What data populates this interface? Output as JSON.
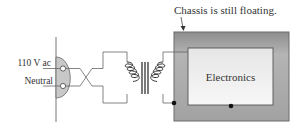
{
  "diagram": {
    "title_note": "Chassis is still floating.",
    "outlet": {
      "hot_label": "110 V ac",
      "neutral_label": "Neutral"
    },
    "transformer": {
      "type": "isolation-transformer",
      "primary": "primary-coil",
      "secondary": "secondary-coil"
    },
    "chassis": {
      "label": "Chassis is still floating.",
      "inner_label": "Electronics"
    },
    "colors": {
      "line": "#555555",
      "outlet_fill": "#c8c8c8",
      "chassis_fill": "#9a9a9a",
      "electronics_fill": "#f2f2f2",
      "dot": "#111111"
    }
  }
}
